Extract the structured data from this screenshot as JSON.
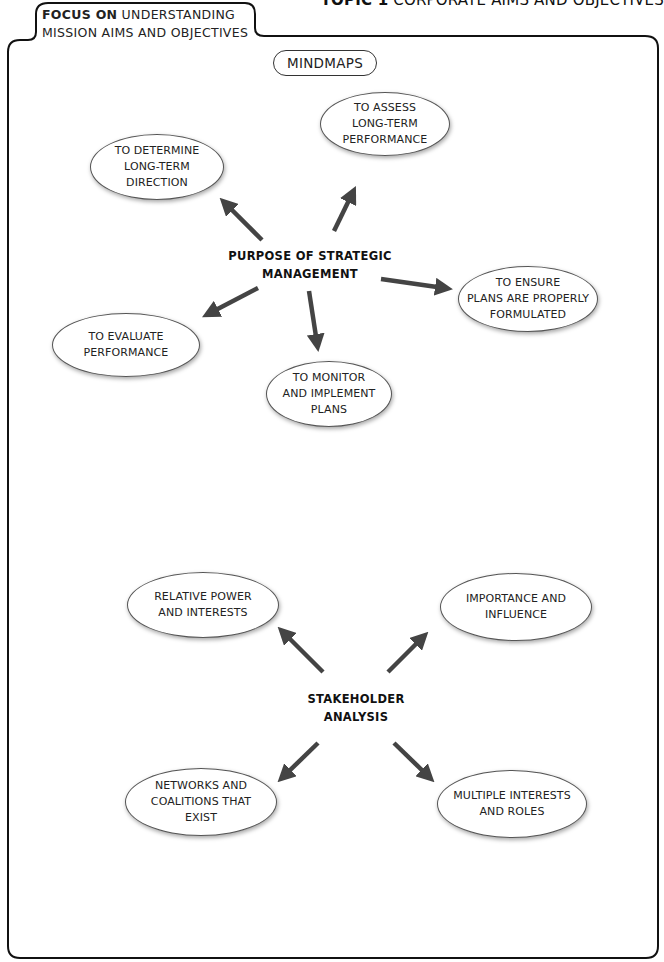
{
  "header": {
    "topic_label": "TOPIC 1",
    "topic_title": "CORPORATE AIMS AND OBJECTIVES",
    "focus_bold": "FOCUS ON",
    "focus_rest": " UNDERSTANDING",
    "focus_line2": "MISSION AIMS AND OBJECTIVES"
  },
  "section_label": "MINDMAPS",
  "mindmaps": [
    {
      "center": "PURPOSE OF STRATEGIC\nMANAGEMENT",
      "nodes": [
        "TO DETERMINE\nLONG-TERM\nDIRECTION",
        "TO ASSESS\nLONG-TERM\nPERFORMANCE",
        "TO ENSURE\nPLANS ARE PROPERLY\nFORMULATED",
        "TO EVALUATE\nPERFORMANCE",
        "TO MONITOR\nAND IMPLEMENT\nPLANS"
      ]
    },
    {
      "center": "STAKEHOLDER\nANALYSIS",
      "nodes": [
        "RELATIVE POWER\nAND INTERESTS",
        "IMPORTANCE AND\nINFLUENCE",
        "NETWORKS AND\nCOALITIONS THAT\nEXIST",
        "MULTIPLE INTERESTS\nAND ROLES"
      ]
    }
  ],
  "colors": {
    "arrow": "#444444",
    "outline": "#111111"
  }
}
